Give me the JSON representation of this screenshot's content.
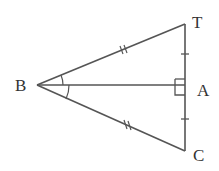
{
  "diagram": {
    "type": "geometry",
    "points": {
      "B": {
        "label": "B",
        "x": 37,
        "y": 85
      },
      "T": {
        "label": "T",
        "x": 185,
        "y": 24
      },
      "A": {
        "label": "A",
        "x": 185,
        "y": 85
      },
      "C": {
        "label": "C",
        "x": 185,
        "y": 151
      }
    },
    "segments": [
      "BT",
      "BC",
      "BA",
      "TC"
    ],
    "marks": {
      "congruent_double_tick": [
        "BT",
        "BC"
      ],
      "congruent_single_tick": [
        "TA",
        "AC"
      ],
      "right_angle_at": "A",
      "equal_angles_at_B": [
        "TBA",
        "ABC"
      ]
    },
    "stroke_color": "#555555"
  }
}
